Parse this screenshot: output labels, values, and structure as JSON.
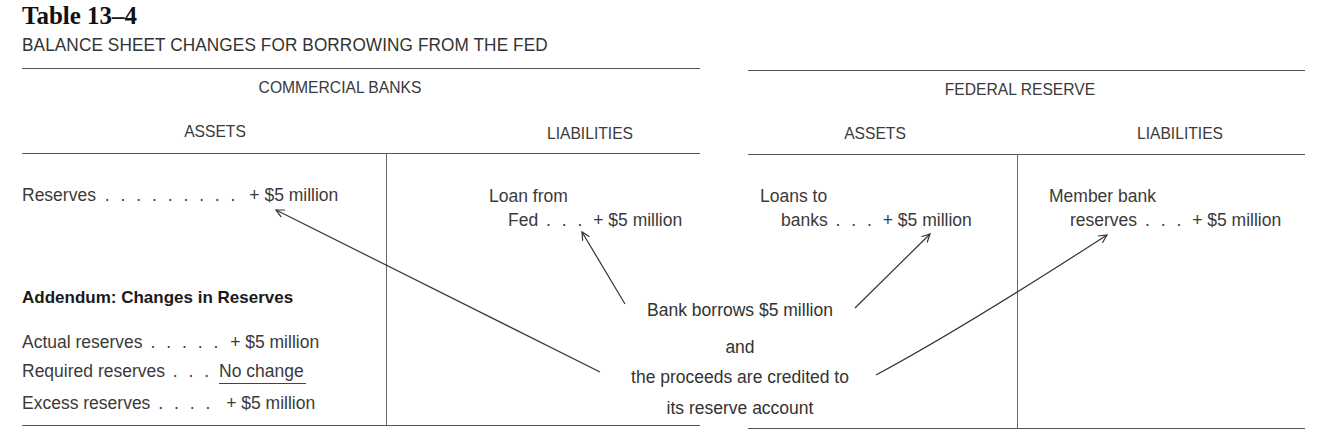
{
  "table": {
    "number": "Table 13–4",
    "title": "BALANCE SHEET CHANGES FOR BORROWING FROM THE FED"
  },
  "commercial_banks": {
    "heading": "COMMERCIAL BANKS",
    "assets": {
      "heading": "ASSETS",
      "items": [
        {
          "label": "Reserves",
          "dots": ". . . . . . . . .",
          "value": "+ $5 million"
        }
      ]
    },
    "liabilities": {
      "heading": "LIABILITIES",
      "items": [
        {
          "label_line1": "Loan from",
          "label_line2": "Fed",
          "dots": ". . .",
          "value": "+ $5 million"
        }
      ]
    },
    "addendum": {
      "heading": "Addendum:  Changes in Reserves",
      "rows": [
        {
          "label": "Actual reserves",
          "dots": ". . . . .",
          "value": "+ $5 million"
        },
        {
          "label": "Required reserves",
          "dots": ". . .",
          "value": "No change"
        },
        {
          "label": "Excess reserves",
          "dots": ". . . .",
          "value": "+ $5 million"
        }
      ]
    }
  },
  "federal_reserve": {
    "heading": "FEDERAL RESERVE",
    "assets": {
      "heading": "ASSETS",
      "items": [
        {
          "label_line1": "Loans to",
          "label_line2": "banks",
          "dots": ". . .",
          "value": "+ $5 million"
        }
      ]
    },
    "liabilities": {
      "heading": "LIABILITIES",
      "items": [
        {
          "label_line1": "Member bank",
          "label_line2": "reserves",
          "dots": ". . .",
          "value": "+ $5 million"
        }
      ]
    }
  },
  "annotation": {
    "line1": "Bank borrows $5 million",
    "line2": "and",
    "line3": "the proceeds are credited to",
    "line4": "its reserve account"
  },
  "colors": {
    "text": "#2a2a2a",
    "rule": "#555555",
    "background": "#ffffff"
  }
}
